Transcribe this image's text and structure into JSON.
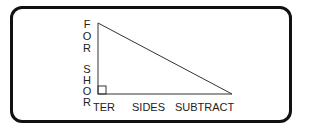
{
  "diagram": {
    "type": "right-triangle-mnemonic",
    "vertical_label_top": [
      "F",
      "O",
      "R"
    ],
    "vertical_label_bottom": [
      "S",
      "H",
      "O",
      "R"
    ],
    "bottom_label": {
      "part1": "TER",
      "part2": "SIDES",
      "part3": "SUBTRACT"
    },
    "colors": {
      "line": "#333333",
      "border": "#111111",
      "text": "#222222"
    }
  }
}
